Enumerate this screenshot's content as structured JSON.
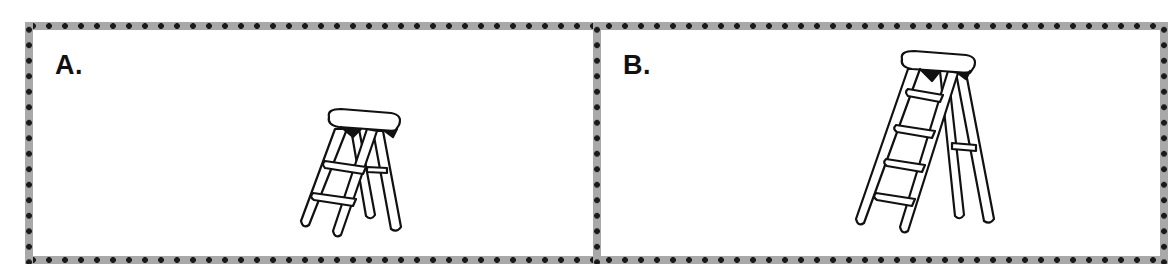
{
  "panels": [
    {
      "id": "A",
      "label": "A.",
      "image": "short-step-ladder-icon",
      "description": "short stepladder with two steps"
    },
    {
      "id": "B",
      "label": "B.",
      "image": "tall-step-ladder-icon",
      "description": "tall stepladder with four steps"
    }
  ],
  "colors": {
    "border_band": "#a9a9a9",
    "border_dot": "#1a1a1a",
    "line": "#111111",
    "background": "#ffffff"
  }
}
